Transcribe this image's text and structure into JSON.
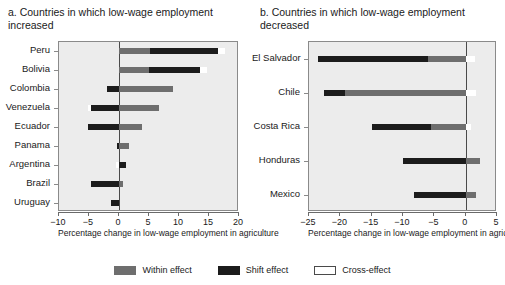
{
  "chart_data": [
    {
      "type": "bar",
      "title": "a. Countries in which low-wage employment increased",
      "xlabel": "Percentage change in low-wage employment in agriculture",
      "ylabel": "",
      "xlim": [
        -10,
        20
      ],
      "xticks": [
        -10,
        -5,
        0,
        5,
        10,
        15,
        20
      ],
      "xticklabels": [
        "−10",
        "−5",
        "0",
        "5",
        "10",
        "15",
        "20"
      ],
      "grid": false,
      "orientation": "horizontal",
      "stacked": true,
      "categories": [
        "Peru",
        "Bolivia",
        "Colombia",
        "Venezuela",
        "Ecuador",
        "Panama",
        "Argentina",
        "Brazil",
        "Uruguay"
      ],
      "series": [
        {
          "name": "Within effect",
          "color": "#6e6e6e",
          "values": [
            5.2,
            5.0,
            9.0,
            6.7,
            3.9,
            1.7,
            0.0,
            0.7,
            0.0
          ]
        },
        {
          "name": "Shift effect",
          "color": "#1c1c1c",
          "values": [
            11.3,
            8.5,
            -2.0,
            -4.7,
            -5.1,
            -0.4,
            1.2,
            -4.6,
            -1.4
          ]
        },
        {
          "name": "Cross-effect",
          "color": "#ffffff",
          "values": [
            1.2,
            1.1,
            0.0,
            -0.5,
            0.0,
            0.0,
            -0.5,
            0.0,
            0.0
          ]
        }
      ]
    },
    {
      "type": "bar",
      "title": "b. Countries in which low-wage employment decreased",
      "xlabel": "Percentage change in low-wage employment in agriculture",
      "ylabel": "",
      "xlim": [
        -25,
        5
      ],
      "xticks": [
        -25,
        -20,
        -15,
        -10,
        -5,
        0,
        5
      ],
      "xticklabels": [
        "−25",
        "−20",
        "−15",
        "−10",
        "−5",
        "0",
        "5"
      ],
      "grid": false,
      "orientation": "horizontal",
      "stacked": true,
      "categories": [
        "El Salvador",
        "Chile",
        "Costa Rica",
        "Honduras",
        "Mexico"
      ],
      "series": [
        {
          "name": "Within effect",
          "color": "#6e6e6e",
          "values": [
            -6.0,
            -19.2,
            -5.6,
            2.3,
            1.7
          ]
        },
        {
          "name": "Shift effect",
          "color": "#1c1c1c",
          "values": [
            -17.5,
            -3.4,
            -9.4,
            -10.0,
            -8.3
          ]
        },
        {
          "name": "Cross-effect",
          "color": "#ffffff",
          "values": [
            1.5,
            1.6,
            0.9,
            0.0,
            0.0
          ]
        }
      ]
    }
  ],
  "panel_a": {
    "title": "a. Countries in which low-wage employment increased",
    "axis_title": "Percentage change in low-wage employment in agriculture",
    "categories": [
      {
        "label": "Peru"
      },
      {
        "label": "Bolivia"
      },
      {
        "label": "Colombia"
      },
      {
        "label": "Venezuela"
      },
      {
        "label": "Ecuador"
      },
      {
        "label": "Panama"
      },
      {
        "label": "Argentina"
      },
      {
        "label": "Brazil"
      },
      {
        "label": "Uruguay"
      }
    ],
    "ticks": [
      {
        "label": "−10"
      },
      {
        "label": "−5"
      },
      {
        "label": "0"
      },
      {
        "label": "5"
      },
      {
        "label": "10"
      },
      {
        "label": "15"
      },
      {
        "label": "20"
      }
    ]
  },
  "panel_b": {
    "title": "b. Countries in which low-wage employment decreased",
    "axis_title": "Percentage change in low-wage employment in agriculture",
    "categories": [
      {
        "label": "El Salvador"
      },
      {
        "label": "Chile"
      },
      {
        "label": "Costa Rica"
      },
      {
        "label": "Honduras"
      },
      {
        "label": "Mexico"
      }
    ],
    "ticks": [
      {
        "label": "−25"
      },
      {
        "label": "−20"
      },
      {
        "label": "−15"
      },
      {
        "label": "−10"
      },
      {
        "label": "−5"
      },
      {
        "label": "0"
      },
      {
        "label": "5"
      }
    ]
  },
  "legend": {
    "items": [
      {
        "label": "Within effect",
        "color": "#6e6e6e"
      },
      {
        "label": "Shift effect",
        "color": "#1c1c1c"
      },
      {
        "label": "Cross-effect",
        "color": "#ffffff"
      }
    ]
  }
}
